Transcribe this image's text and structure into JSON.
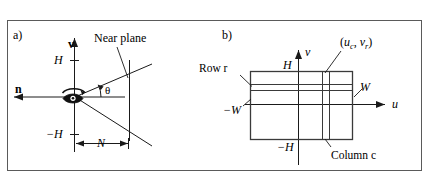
{
  "figure": {
    "caption_panels": [
      "a)",
      "b)"
    ],
    "border_color": "#555555",
    "line_color": "#1a1a1a",
    "background": "#ffffff"
  },
  "panel_a": {
    "letter": "a)",
    "labels": {
      "up_vector": "v",
      "view_vector": "n",
      "top_extent": "H",
      "bottom_extent": "−H",
      "near_distance": "N",
      "fov_angle": "θ",
      "near_plane": "Near plane"
    },
    "icons": {
      "eye": "eye-icon",
      "v_axis_arrow": "arrow-up-icon",
      "n_axis_arrow": "arrow-left-icon"
    }
  },
  "panel_b": {
    "letter": "b)",
    "labels": {
      "v_axis": "v",
      "u_axis": "u",
      "top_extent": "H",
      "bottom_extent": "−H",
      "right_extent": "W",
      "left_extent": "−W",
      "row_label": "Row r",
      "column_label": "Column c",
      "pixel_center": "(u_c, v_r)",
      "pixel_center_parts": {
        "open": "(",
        "u_base": "u",
        "u_sub": "c",
        "comma": ", ",
        "v_base": "v",
        "v_sub": "r",
        "close": ")"
      }
    },
    "icons": {
      "u_axis_arrow": "arrow-right-icon",
      "v_axis_arrow": "arrow-up-icon"
    }
  }
}
